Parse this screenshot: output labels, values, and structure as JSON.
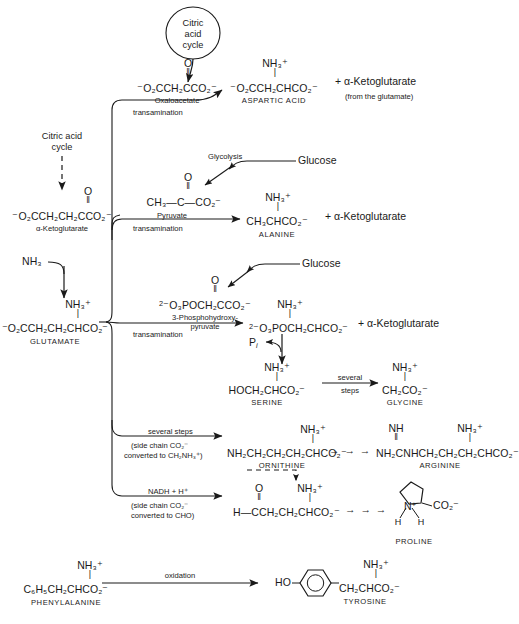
{
  "diagram": {
    "citric_acid_cycle_bubble": "Citric\nacid\ncycle",
    "citric_bubble_l1": "Citric",
    "citric_bubble_l2": "acid",
    "citric_bubble_l3": "cycle"
  },
  "left_column": {
    "source_l1": "Citric acid",
    "source_l2": "cycle",
    "ketoglutarate_formula_pre": "⁻O",
    "ketoglutarate_formula": "⁻O₂CCH₂CH₂CCO₂⁻",
    "ketoglutarate_carbonyl_O": "O",
    "ketoglutarate_carbonyl_bond": "‖",
    "ketoglutarate_name": "α-Ketoglutarate",
    "ammonia": "NH₃",
    "glutamate_formula": "⁻O₂CCH₂CH₂CHCO₂⁻",
    "glutamate_amino": "NH₃⁺",
    "glutamate_bond": "|",
    "glutamate_name": "GLUTAMATE"
  },
  "reactions": [
    {
      "id": "aspartate",
      "substrate_formula": "⁻O₂CCH₂CCO₂⁻",
      "substrate_carbonyl_O": "O",
      "substrate_carbonyl_bond": "‖",
      "substrate_name": "Oxaloacetate",
      "arrow_label": "transamination",
      "product_formula": "⁻O₂CCH₂CHCO₂⁻",
      "product_amino": "NH₃⁺",
      "product_bond": "|",
      "product_name": "ASPARTIC  ACID",
      "coproduct": "+ α-Ketoglutarate",
      "coproduct_note": "(from the glutamate)"
    },
    {
      "id": "alanine",
      "precursor_label": "Glycolysis",
      "precursor_source": "Glucose",
      "substrate_formula": "CH₃—C—CO₂⁻",
      "substrate_carbonyl_O": "O",
      "substrate_carbonyl_bond": "‖",
      "substrate_name": "Pyruvate",
      "arrow_label": "transamination",
      "product_formula": "CH₃CHCO₂⁻",
      "product_amino": "NH₃⁺",
      "product_bond": "|",
      "product_name": "ALANINE",
      "coproduct": "+ α-Ketoglutarate"
    },
    {
      "id": "serine",
      "precursor_source": "Glucose",
      "substrate_formula": "⁻O₃POCH₂CCO₂⁻",
      "substrate_charge": "2",
      "substrate_carbonyl_O": "O",
      "substrate_carbonyl_bond": "‖",
      "substrate_name_l1": "3-Phosphohydroxy-",
      "substrate_name_l2": "pyruvate",
      "arrow_label": "transamination",
      "product_formula": "⁻O₃POCH₂CHCO₂⁻",
      "product_charge": "2",
      "product_amino": "NH₃⁺",
      "product_bond": "|",
      "coproduct": "+ α-Ketoglutarate",
      "released": "P",
      "released_sub": "i",
      "serine_formula": "HOCH₂CHCO₂⁻",
      "serine_amino": "NH₃⁺",
      "serine_bond": "|",
      "serine_name": "SERINE",
      "steps_l1": "several",
      "steps_l2": "steps",
      "glycine_formula": "CH₂CO₂⁻",
      "glycine_amino": "NH₃⁺",
      "glycine_bond": "|",
      "glycine_name": "GLYCINE"
    },
    {
      "id": "ornithine",
      "arrow_label": "several steps",
      "arrow_note_l1": "(side chain CO₂⁻",
      "arrow_note_l2": "converted to CH₂NH₃⁺)",
      "product_formula": "NH₂CH₂CH₂CH₂CHCO₂⁻",
      "product_amino": "NH₃⁺",
      "product_bond": "|",
      "product_name": "ORNITHINE",
      "chain_arrows": "→ → →",
      "arginine_formula": "NH₂CNHCH₂CH₂CH₂CHCO₂⁻",
      "arginine_imino": "NH",
      "arginine_imino_bond": "‖",
      "arginine_amino": "NH₃⁺",
      "arginine_bond": "|",
      "arginine_name": "ARGININE"
    },
    {
      "id": "proline",
      "arrow_label": "NADH + H⁺",
      "arrow_note_l1": "(side chain CO₂⁻",
      "arrow_note_l2": "converted to CHO)",
      "product_formula": "H—CCH₂CH₂CHCO₂⁻",
      "product_carbonyl_O": "O",
      "product_carbonyl_bond": "‖",
      "product_amino": "NH₃⁺",
      "product_bond": "|",
      "chain_arrows": "→ → →",
      "proline_N": "N",
      "proline_N_charge": "+",
      "proline_H_left": "H",
      "proline_H_right": "H",
      "proline_carboxyl": "CO₂⁻",
      "proline_name": "PROLINE"
    }
  ],
  "bottom_reaction": {
    "id": "tyrosine",
    "substrate_formula": "C₆H₅CH₂CHCO₂⁻",
    "substrate_amino": "NH₃⁺",
    "substrate_bond": "|",
    "substrate_name": "PHENYLALANINE",
    "arrow_label": "oxidation",
    "product_prefix": "HO",
    "product_formula": "CH₂CHCO₂⁻",
    "product_amino": "NH₃⁺",
    "product_bond": "|",
    "product_name": "TYROSINE"
  },
  "colors": {
    "ink": "#1a1a1a",
    "background": "#ffffff"
  }
}
